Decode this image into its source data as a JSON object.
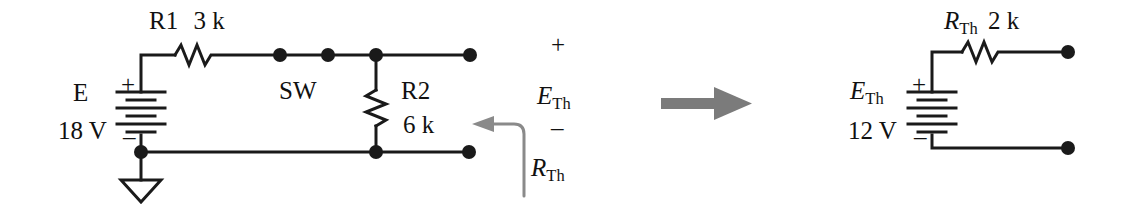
{
  "figure": {
    "type": "circuit-schematic",
    "stroke_color": "#1a1a1a",
    "accent_color": "#7a7a7a"
  },
  "left_circuit": {
    "name": "original-network",
    "source": {
      "symbol_label": "E",
      "value_label": "18 V",
      "plus_sign": "+",
      "minus_sign": "–"
    },
    "r1": {
      "label": "R1",
      "value": "3 k"
    },
    "switch": {
      "label": "SW"
    },
    "r2": {
      "label": "R2",
      "value": "6 k"
    },
    "output": {
      "plus_sign": "+",
      "minus_sign": "–",
      "voltage_symbol": "E",
      "voltage_subscript": "Th"
    },
    "callout": {
      "symbol": "R",
      "subscript": "Th"
    },
    "ground": {
      "name": "earth-ground"
    }
  },
  "transform_arrow": {
    "direction": "right",
    "color": "#7a7a7a"
  },
  "right_circuit": {
    "name": "thevenin-equivalent",
    "resistor": {
      "symbol": "R",
      "subscript": "Th",
      "value": "2 k"
    },
    "source": {
      "symbol": "E",
      "subscript": "Th",
      "value_label": "12 V",
      "plus_sign": "+",
      "minus_sign": "–"
    }
  }
}
